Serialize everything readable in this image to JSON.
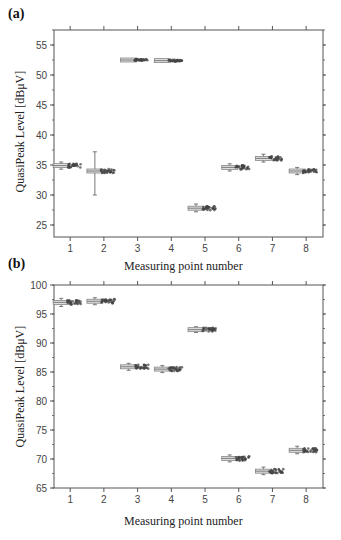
{
  "chart_data": [
    {
      "type": "box",
      "panel_label": "(a)",
      "title": "",
      "xlabel": "Measuring point number",
      "ylabel": "QuasiPeak Level [dBμV]",
      "categories": [
        "1",
        "2",
        "3",
        "4",
        "5",
        "6",
        "7",
        "8"
      ],
      "yticks": [
        25,
        30,
        35,
        40,
        45,
        50,
        55
      ],
      "ylim": [
        23,
        57.5
      ],
      "xlim": [
        0.52,
        8.5
      ],
      "grid": false,
      "series": [
        {
          "name": "median",
          "values": [
            34.9,
            34.0,
            52.5,
            52.4,
            27.8,
            34.6,
            36.1,
            34.0
          ]
        },
        {
          "name": "whisker_low",
          "values": [
            34.3,
            30.0,
            52.3,
            52.2,
            27.2,
            34.0,
            35.5,
            33.4
          ]
        },
        {
          "name": "whisker_high",
          "values": [
            35.5,
            37.2,
            52.7,
            52.6,
            28.5,
            35.2,
            36.8,
            34.6
          ]
        }
      ]
    },
    {
      "type": "box",
      "panel_label": "(b)",
      "title": "",
      "xlabel": "Measuring point number",
      "ylabel": "QuasiPeak Level [dBμV]",
      "categories": [
        "1",
        "2",
        "3",
        "4",
        "5",
        "6",
        "7",
        "8"
      ],
      "yticks": [
        65,
        70,
        75,
        80,
        85,
        90,
        95,
        100
      ],
      "ylim": [
        65,
        100
      ],
      "xlim": [
        0.52,
        8.5
      ],
      "grid": false,
      "series": [
        {
          "name": "median",
          "values": [
            97.0,
            97.2,
            85.9,
            85.5,
            92.3,
            70.1,
            67.9,
            71.5
          ]
        },
        {
          "name": "whisker_low",
          "values": [
            96.3,
            96.6,
            85.3,
            84.9,
            91.8,
            69.5,
            67.3,
            70.9
          ]
        },
        {
          "name": "whisker_high",
          "values": [
            97.7,
            97.8,
            86.5,
            86.1,
            92.8,
            70.7,
            68.6,
            72.2
          ]
        }
      ]
    }
  ],
  "panels": {
    "a": {
      "label": "(a)",
      "xlabel": "Measuring point number",
      "ylabel": "QuasiPeak Level [dBμV]"
    },
    "b": {
      "label": "(b)",
      "xlabel": "Measuring point number",
      "ylabel": "QuasiPeak Level [dBμV]"
    }
  },
  "colors": {
    "axis": "#555555",
    "box": "#888888",
    "points": "#444444"
  }
}
